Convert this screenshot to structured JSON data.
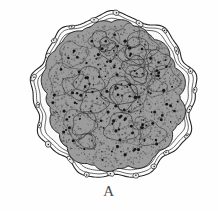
{
  "figure": {
    "label": "A",
    "domain_type": "histological-illustration",
    "background_color": "#fefefe",
    "ink_color": "#1d1d1d",
    "caption_color": "#4a4a4a"
  },
  "canvas": {
    "width": 218,
    "height": 211
  },
  "specimen": {
    "center_x": 114,
    "center_y": 96,
    "outer_capsule": {
      "name": "outer-capsule",
      "radius_x": 81,
      "radius_y": 82,
      "rotation_deg": -18,
      "stroke_color": "#262626",
      "stroke_width": 1.1,
      "fill_color": "#fdfdfd",
      "waviness_amplitude": 3.2,
      "lobe_count": 9
    },
    "inner_capsule_line": {
      "name": "inner-capsule-line",
      "radius_x": 74,
      "radius_y": 75,
      "stroke_color": "#3a3a3a",
      "stroke_width": 0.8
    },
    "clear_space": {
      "name": "perivitelline-space",
      "fill_color": "#fafafa",
      "thickness": 9
    },
    "cell_mass": {
      "name": "inner-cell-mass",
      "radius_x": 66,
      "radius_y": 67,
      "rotation_deg": -18,
      "base_fill": "#9c9c9c",
      "stroke_color": "#1f1f1f",
      "stroke_width": 1.0,
      "lobule_count": 26,
      "lobule_min_radius": 9,
      "lobule_max_radius": 16
    },
    "capsule_nuclei": {
      "name": "capsule-nuclei",
      "count": 22,
      "fill_color": "#e9e9e9",
      "stroke_color": "#2a2a2a",
      "radius_x": 3.4,
      "radius_y": 2.2
    },
    "cell_nuclei": {
      "name": "cell-nuclei-dots",
      "count": 150,
      "fill_color": "#141414",
      "radius": 1.15
    },
    "stipple": {
      "name": "cytoplasm-stipple",
      "count": 2600,
      "color": "#4e4e4e",
      "opacity": 0.55
    }
  },
  "colors": {
    "paper": "#fefefe",
    "dark_ink": "#1d1d1d",
    "mid_grey": "#9c9c9c",
    "light_grey": "#d6d6d6",
    "caption": "#4a4a4a"
  }
}
